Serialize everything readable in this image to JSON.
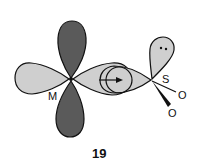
{
  "figure": {
    "number": "19",
    "atoms": {
      "metal": "M",
      "sulfur": "S",
      "oxygen_1": "O",
      "oxygen_2": "O"
    },
    "lone_pair": "••",
    "colors": {
      "dark_lobe": "#5a5a5a",
      "light_lobe": "#cfcfcf",
      "outline": "#111111",
      "background": "#ffffff"
    }
  }
}
